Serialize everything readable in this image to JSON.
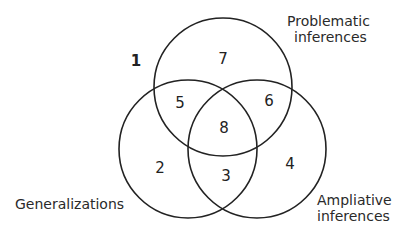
{
  "diagram": {
    "type": "venn",
    "outside_region": {
      "label": "1",
      "x": 132,
      "y": 61
    },
    "circles": [
      {
        "id": "problematic",
        "cx": 223,
        "cy": 87,
        "r": 69
      },
      {
        "id": "generalizations",
        "cx": 188,
        "cy": 149,
        "r": 69
      },
      {
        "id": "ampliative",
        "cx": 257,
        "cy": 149,
        "r": 69
      }
    ],
    "sets": {
      "problematic": {
        "line1": "Problematic",
        "line2": "inferences"
      },
      "generalizations": {
        "line1": "Generalizations"
      },
      "ampliative": {
        "line1": "Ampliative",
        "line2": "inferences"
      }
    },
    "regions": {
      "r1": "1",
      "r2": "2",
      "r3": "3",
      "r4": "4",
      "r5": "5",
      "r6": "6",
      "r7": "7",
      "r8": "8"
    }
  }
}
